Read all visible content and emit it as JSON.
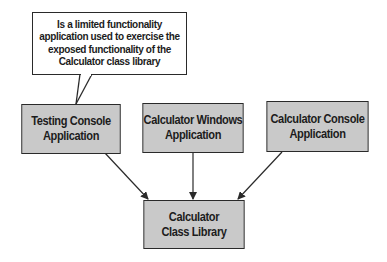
{
  "diagram": {
    "callout": {
      "text": "Is a limited functionality application used to exercise the exposed functionality of the Calculator class library"
    },
    "nodes": [
      {
        "id": "testing-console",
        "line1": "Testing Console",
        "line2": "Application"
      },
      {
        "id": "calculator-windows",
        "line1": "Calculator Windows",
        "line2": "Application"
      },
      {
        "id": "calculator-console",
        "line1": "Calculator Console",
        "line2": "Application"
      },
      {
        "id": "calculator-library",
        "line1": "Calculator",
        "line2": "Class Library"
      }
    ],
    "edges": [
      {
        "from": "testing-console",
        "to": "calculator-library"
      },
      {
        "from": "calculator-windows",
        "to": "calculator-library"
      },
      {
        "from": "calculator-console",
        "to": "calculator-library"
      }
    ],
    "colors": {
      "box_fill": "#c9c9c9",
      "stroke": "#2a2a2a",
      "text": "#1c1c1c",
      "background": "#ffffff"
    }
  }
}
